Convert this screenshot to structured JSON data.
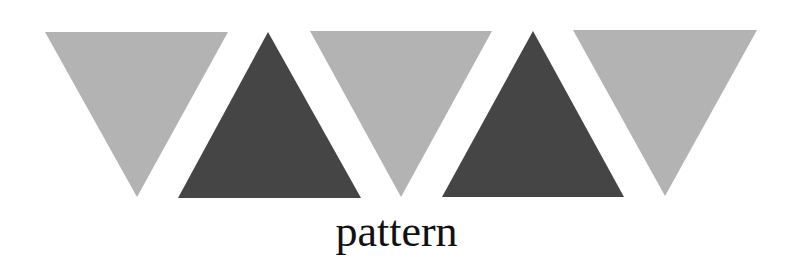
{
  "diagram": {
    "caption": "pattern",
    "colors": {
      "light": "#b3b3b3",
      "dark": "#454545",
      "background": "#ffffff",
      "text": "#111111"
    },
    "triangles": [
      {
        "id": "triangle-1",
        "direction": "down",
        "shade": "light",
        "points": "45,32 228,32 137,197"
      },
      {
        "id": "triangle-2",
        "direction": "up",
        "shade": "dark",
        "points": "268,32 361,198 178,198"
      },
      {
        "id": "triangle-3",
        "direction": "down",
        "shade": "light",
        "points": "310,31 492,31 401,197"
      },
      {
        "id": "triangle-4",
        "direction": "up",
        "shade": "dark",
        "points": "533,31 624,197 442,197"
      },
      {
        "id": "triangle-5",
        "direction": "down",
        "shade": "light",
        "points": "573,30 757,30 665,196"
      }
    ]
  }
}
